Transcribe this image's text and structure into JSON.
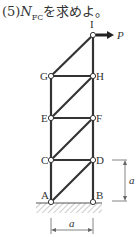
{
  "question": {
    "prefix": "(5)",
    "symbol": "N",
    "subscript": "FC",
    "suffix": "を求めよ。"
  },
  "diagram": {
    "type": "truss",
    "nodes": [
      {
        "id": "I",
        "x": 93,
        "y": 35
      },
      {
        "id": "G",
        "x": 51,
        "y": 76
      },
      {
        "id": "H",
        "x": 93,
        "y": 76
      },
      {
        "id": "E",
        "x": 51,
        "y": 118
      },
      {
        "id": "F",
        "x": 93,
        "y": 118
      },
      {
        "id": "C",
        "x": 51,
        "y": 160
      },
      {
        "id": "D",
        "x": 93,
        "y": 160
      },
      {
        "id": "A",
        "x": 51,
        "y": 202
      },
      {
        "id": "B",
        "x": 93,
        "y": 202
      }
    ],
    "load": {
      "node": "I",
      "label": "P",
      "direction": "right"
    },
    "dimension_vertical": "a",
    "dimension_horizontal": "a"
  }
}
